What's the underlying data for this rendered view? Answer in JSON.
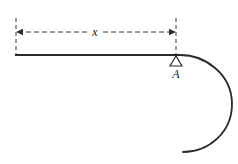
{
  "figure": {
    "type": "engineering-beam-diagram",
    "background_color": "#ffffff",
    "line_color": "#2b2b2b",
    "dimension_color": "#3a3a3a",
    "dimension": {
      "label": "x",
      "label_x": 95,
      "label_y": 36,
      "line_y": 32,
      "start_x": 16,
      "end_x": 176,
      "extension_left": {
        "x": 16,
        "y_top": 18,
        "y_bottom": 55
      },
      "extension_right": {
        "x": 176,
        "y_top": 18,
        "y_bottom": 55
      },
      "arrow_left_direction": "left",
      "arrow_right_direction": "right"
    },
    "beam": {
      "start_x": 15,
      "end_x": 180,
      "y": 55,
      "stroke_width": 2.2
    },
    "curve": {
      "description": "beam curves down and around to the right ending in a short horizontal tail",
      "path": "M 180 55 C 205 55, 232 74, 232 104 C 232 133, 208 152, 183 152",
      "stroke_width": 1.8
    },
    "support": {
      "label": "A",
      "label_x": 176,
      "label_y": 77,
      "type": "pin-support-triangle",
      "apex_x": 176,
      "apex_y": 56,
      "base_y": 66,
      "base_half_width": 6,
      "stroke_width": 1.2
    }
  }
}
